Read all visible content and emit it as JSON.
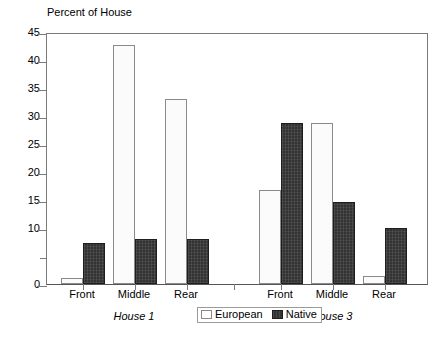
{
  "chart_data": {
    "type": "bar",
    "title": "Percent of House",
    "xlabel": "",
    "ylabel": "",
    "ylim": [
      0,
      45
    ],
    "ytick_step": 5,
    "ytick_labels": [
      "0",
      "",
      "10",
      "15",
      "20",
      "25",
      "30",
      "35",
      "40",
      "45"
    ],
    "ytick_values": [
      0,
      5,
      10,
      15,
      20,
      25,
      30,
      35,
      40,
      45
    ],
    "grid": false,
    "legend_position": "bottom-center",
    "categories": [
      "Front",
      "Middle",
      "Rear"
    ],
    "groups": [
      {
        "name": "House 1",
        "categories": [
          "Front",
          "Middle",
          "Rear"
        ],
        "series": [
          {
            "name": "European",
            "values": [
              1.0,
              42.7,
              33.0
            ]
          },
          {
            "name": "Native",
            "values": [
              7.3,
              8.0,
              8.0
            ]
          }
        ]
      },
      {
        "name": "House 3",
        "categories": [
          "Front",
          "Middle",
          "Rear"
        ],
        "series": [
          {
            "name": "European",
            "values": [
              16.8,
              28.8,
              1.5
            ]
          },
          {
            "name": "Native",
            "values": [
              28.8,
              14.6,
              10.0
            ]
          }
        ]
      }
    ],
    "series_names": [
      "European",
      "Native"
    ],
    "colors": {
      "european": "#fbfbfb",
      "european_border": "#8a8a8a",
      "native": "#333333",
      "native_border": "#1e1e1e",
      "axis": "#7a7a7a",
      "text": "#000000"
    }
  },
  "legend": {
    "entries": [
      {
        "label": "European",
        "swatch": "european"
      },
      {
        "label": "Native",
        "swatch": "native"
      }
    ]
  }
}
